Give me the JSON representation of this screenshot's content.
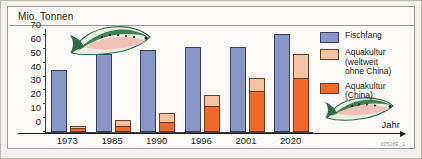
{
  "chart_data": {
    "type": "bar",
    "title": "Mio. Tonnen",
    "xlabel": "Jahr",
    "ylabel": "Mio. Tonnen",
    "categories": [
      "1973",
      "1985",
      "1990",
      "1996",
      "2001",
      "2020"
    ],
    "series": [
      {
        "name": "Fischfang",
        "color": "#8b96c8",
        "values": [
          45,
          56,
          59,
          61,
          61,
          71
        ]
      },
      {
        "name": "Aquakultur (weltweit ohne China)",
        "color": "#f6c3a2",
        "values": [
          1,
          5,
          6.5,
          8,
          9,
          17
        ]
      },
      {
        "name": "Aquakultur (China)",
        "color": "#f0682a",
        "values": [
          3,
          4,
          7.5,
          19,
          30,
          39
        ]
      }
    ],
    "stacked_aquaculture_totals": [
      4,
      9,
      14,
      27,
      39,
      56
    ],
    "ylim": [
      0,
      75
    ],
    "yticks": [
      0,
      10,
      20,
      30,
      40,
      50,
      60,
      70
    ],
    "grid": false,
    "legend_position": "right"
  },
  "legend": {
    "items": [
      {
        "label": "Fischfang",
        "color": "#8b96c8"
      },
      {
        "label": "Aquakultur (weltweit ohne China)",
        "color": "#f6c3a2"
      },
      {
        "label": "Aquakultur (China)",
        "color": "#f0682a"
      }
    ]
  },
  "axis": {
    "y_title": "Mio. Tonnen",
    "x_title": "Jahr"
  },
  "footer": {
    "code": "10508E_1"
  }
}
